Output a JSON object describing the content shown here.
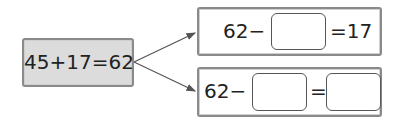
{
  "source_equation": "45+17=62",
  "derived": [
    {
      "prefix": "62−",
      "suffix": "=17",
      "blanks": 1
    },
    {
      "prefix": "62−",
      "middle": "=",
      "blanks": 2
    }
  ],
  "colors": {
    "source_fill": "#dcdcdc",
    "border": "#8a8a8a",
    "arrow": "#555555"
  }
}
